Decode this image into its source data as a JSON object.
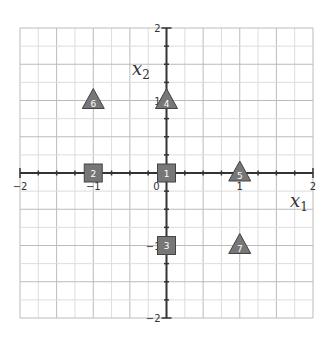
{
  "chart_data": {
    "type": "scatter",
    "title": "",
    "xlabel": "x1",
    "ylabel": "x2",
    "xlabel_parts": {
      "base": "x",
      "sub": "1"
    },
    "ylabel_parts": {
      "base": "x",
      "sub": "2"
    },
    "xlim": [
      -2,
      2
    ],
    "ylim": [
      -2,
      2
    ],
    "grid": true,
    "grid_step": 0.25,
    "x_ticks": [
      -2,
      -1,
      0,
      1,
      2
    ],
    "y_ticks": [
      -2,
      -1,
      1,
      2
    ],
    "x_tick_labels": [
      "−2",
      "−1",
      "0",
      "1",
      "2"
    ],
    "y_tick_labels": [
      "−2",
      "−1",
      "1",
      "2"
    ],
    "legend": null,
    "series": [
      {
        "name": "squares",
        "marker": "square",
        "color": "#777777",
        "points": [
          {
            "label": "1",
            "x": 0,
            "y": 0
          },
          {
            "label": "2",
            "x": -1,
            "y": 0
          },
          {
            "label": "3",
            "x": 0,
            "y": -1
          }
        ]
      },
      {
        "name": "triangles",
        "marker": "triangle",
        "color": "#777777",
        "points": [
          {
            "label": "4",
            "x": 0,
            "y": 1
          },
          {
            "label": "5",
            "x": 1,
            "y": 0
          },
          {
            "label": "6",
            "x": -1,
            "y": 1
          },
          {
            "label": "7",
            "x": 1,
            "y": -1
          }
        ]
      }
    ]
  },
  "colors": {
    "grid_minor": "#dddddd",
    "grid_major": "#bbbbbb",
    "axis": "#333333",
    "marker_fill": "#777777",
    "marker_stroke": "#444444"
  }
}
